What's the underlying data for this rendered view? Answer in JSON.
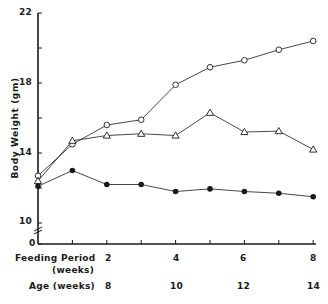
{
  "chart_data": {
    "type": "line",
    "title": "",
    "xlabel": "Feeding Period (weeks)",
    "xlabel_secondary": "Age (weeks)",
    "ylabel": "Body Weight (gm)",
    "x": [
      0,
      1,
      2,
      3,
      4,
      5,
      6,
      7,
      8
    ],
    "ylim": [
      10,
      22
    ],
    "y_axis_break": true,
    "y_ticks": [
      0,
      10,
      14,
      18,
      22
    ],
    "y_minor_ticks": [
      16,
      20
    ],
    "x_tick_labels": {
      "feeding_period": [
        "2",
        "4",
        "6",
        "8"
      ],
      "age": [
        "8",
        "10",
        "12",
        "14"
      ]
    },
    "grid": false,
    "legend": null,
    "series": [
      {
        "name": "open circles",
        "marker": "open-circle",
        "values": [
          12.7,
          14.5,
          15.6,
          15.9,
          17.9,
          18.9,
          19.3,
          19.9,
          20.4
        ]
      },
      {
        "name": "open triangles",
        "marker": "open-triangle",
        "values": [
          12.4,
          14.7,
          15.0,
          15.1,
          15.0,
          16.3,
          15.2,
          15.25,
          14.2
        ]
      },
      {
        "name": "filled circles",
        "marker": "filled-circle",
        "values": [
          12.1,
          13.0,
          12.2,
          12.2,
          11.8,
          11.95,
          11.8,
          11.7,
          11.5
        ]
      }
    ]
  },
  "labels": {
    "y_axis": "Body Weight (gm)",
    "feeding_period": "Feeding Period",
    "feeding_period_unit": "(weeks)",
    "age": "Age (weeks)",
    "ytick_22": "22",
    "ytick_18": "18",
    "ytick_14": "14",
    "ytick_10": "10",
    "ytick_0": "0",
    "fp_2": "2",
    "fp_4": "4",
    "fp_6": "6",
    "fp_8": "8",
    "age_8": "8",
    "age_10": "10",
    "age_12": "12",
    "age_14": "14"
  }
}
